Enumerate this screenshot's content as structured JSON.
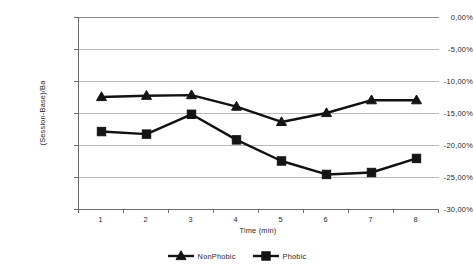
{
  "chart_data": {
    "type": "line",
    "title": "",
    "xlabel": "Time (min)",
    "ylabel": "(Session-Base)/Ba",
    "categories": [
      "1",
      "2",
      "3",
      "4",
      "5",
      "6",
      "7",
      "8"
    ],
    "ytick_labels": [
      "0,00%",
      "-5,00%",
      "-10,00%",
      "-15,00%",
      "-20,00%",
      "-25,00%",
      "-30,00%"
    ],
    "ytick_values": [
      0,
      -5,
      -10,
      -15,
      -20,
      -25,
      -30
    ],
    "ylim": [
      -30,
      0
    ],
    "grid": "horizontal",
    "legend_position": "bottom",
    "series": [
      {
        "name": "NonPhobic",
        "marker": "triangle",
        "color": "#141414",
        "values": [
          -12.5,
          -12.3,
          -12.2,
          -14.0,
          -16.4,
          -15.0,
          -13.0,
          -13.0
        ]
      },
      {
        "name": "Phobic",
        "marker": "square",
        "color": "#141414",
        "values": [
          -17.9,
          -18.3,
          -15.2,
          -19.2,
          -22.5,
          -24.6,
          -24.3,
          -22.1
        ]
      }
    ]
  }
}
